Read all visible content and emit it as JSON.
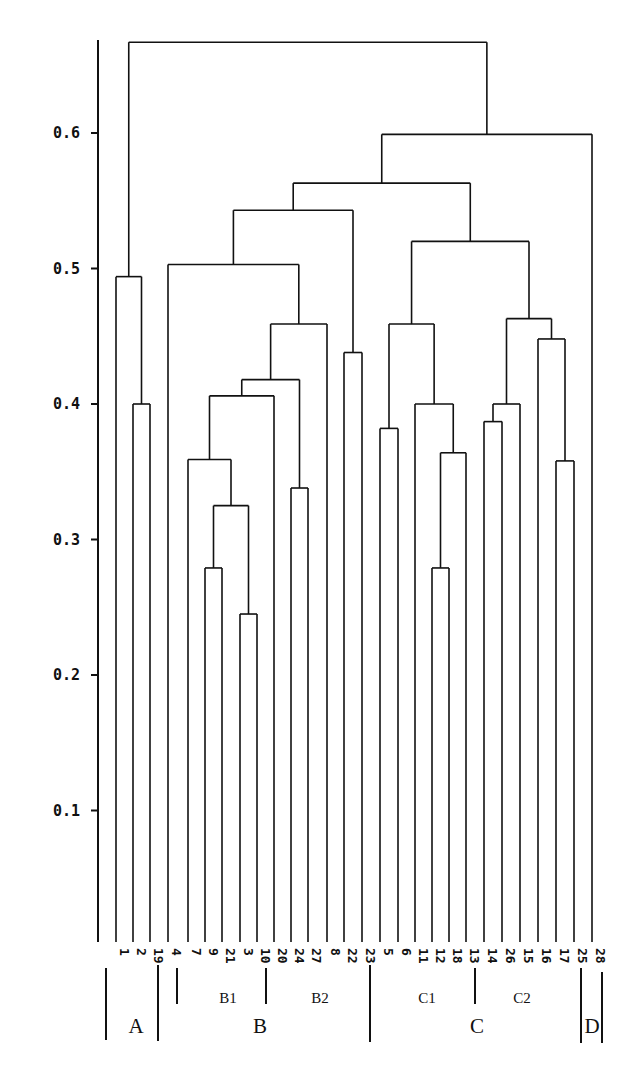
{
  "chart_data": {
    "type": "dendrogram",
    "title": "",
    "xlabel": "",
    "ylabel": "",
    "ylim": [
      0.0,
      0.67
    ],
    "y_ticks": [
      "0.1",
      "0.2",
      "0.3",
      "0.4",
      "0.5",
      "0.6"
    ],
    "leaf_order": [
      "1",
      "2",
      "19",
      "4",
      "7",
      "9",
      "21",
      "3",
      "10",
      "20",
      "24",
      "27",
      "8",
      "22",
      "23",
      "5",
      "6",
      "11",
      "12",
      "18",
      "13",
      "14",
      "26",
      "15",
      "16",
      "17",
      "25",
      "28"
    ],
    "merges": [
      {
        "id": "m1",
        "left": "2",
        "right": "19",
        "height": 0.4
      },
      {
        "id": "m2",
        "left": "1",
        "right": "m1",
        "height": 0.494
      },
      {
        "id": "m3",
        "left": "9",
        "right": "21",
        "height": 0.279
      },
      {
        "id": "m4",
        "left": "3",
        "right": "10",
        "height": 0.245
      },
      {
        "id": "m5",
        "left": "m3",
        "right": "m4",
        "height": 0.325
      },
      {
        "id": "m6",
        "left": "7",
        "right": "m5",
        "height": 0.359
      },
      {
        "id": "m7",
        "left": "m6",
        "right": "20",
        "height": 0.406
      },
      {
        "id": "m8",
        "left": "24",
        "right": "27",
        "height": 0.338
      },
      {
        "id": "m9",
        "left": "m7",
        "right": "m8",
        "height": 0.418
      },
      {
        "id": "m10",
        "left": "m9",
        "right": "8",
        "height": 0.459
      },
      {
        "id": "m11",
        "left": "4",
        "right": "m10",
        "height": 0.503
      },
      {
        "id": "m12",
        "left": "22",
        "right": "23",
        "height": 0.438
      },
      {
        "id": "m13",
        "left": "m11",
        "right": "m12",
        "height": 0.543
      },
      {
        "id": "m14",
        "left": "5",
        "right": "6",
        "height": 0.382
      },
      {
        "id": "m15",
        "left": "12",
        "right": "18",
        "height": 0.279
      },
      {
        "id": "m16",
        "left": "m15",
        "right": "13",
        "height": 0.364
      },
      {
        "id": "m17",
        "left": "11",
        "right": "m16",
        "height": 0.4
      },
      {
        "id": "m18",
        "left": "m14",
        "right": "m17",
        "height": 0.459
      },
      {
        "id": "m19",
        "left": "14",
        "right": "26",
        "height": 0.387
      },
      {
        "id": "m20",
        "left": "m19",
        "right": "15",
        "height": 0.4
      },
      {
        "id": "m21",
        "left": "17",
        "right": "25",
        "height": 0.358
      },
      {
        "id": "m22",
        "left": "16",
        "right": "m21",
        "height": 0.448
      },
      {
        "id": "m23",
        "left": "m20",
        "right": "m22",
        "height": 0.463
      },
      {
        "id": "m24",
        "left": "m18",
        "right": "m23",
        "height": 0.52
      },
      {
        "id": "m25",
        "left": "m13",
        "right": "m24",
        "height": 0.563
      },
      {
        "id": "m26",
        "left": "m25",
        "right": "28",
        "height": 0.599
      },
      {
        "id": "m27",
        "left": "m2",
        "right": "m26",
        "height": 0.667
      }
    ],
    "groups": [
      {
        "label": "A",
        "level": "major",
        "leaves": [
          "1",
          "2",
          "19"
        ]
      },
      {
        "label": "B",
        "level": "major",
        "leaves": [
          "4",
          "7",
          "9",
          "21",
          "3",
          "10",
          "20",
          "24",
          "27",
          "8",
          "22",
          "23"
        ]
      },
      {
        "label": "C",
        "level": "major",
        "leaves": [
          "5",
          "6",
          "11",
          "12",
          "18",
          "13",
          "14",
          "26",
          "15",
          "16",
          "17",
          "25"
        ]
      },
      {
        "label": "D",
        "level": "major",
        "leaves": [
          "28"
        ]
      },
      {
        "label": "B1",
        "level": "minor",
        "leaves": [
          "7",
          "9",
          "21",
          "3",
          "10"
        ]
      },
      {
        "label": "B2",
        "level": "minor",
        "leaves": [
          "20",
          "24",
          "27",
          "8",
          "22",
          "23"
        ]
      },
      {
        "label": "C1",
        "level": "minor",
        "leaves": [
          "5",
          "6",
          "11",
          "12",
          "18",
          "13"
        ]
      },
      {
        "label": "C2",
        "level": "minor",
        "leaves": [
          "14",
          "26",
          "15",
          "16",
          "17",
          "25"
        ]
      }
    ]
  },
  "layout": {
    "axis_x": 98,
    "axis_top": 40,
    "axis_bottom": 942,
    "y_zero_px": 946,
    "px_per_unit": 1355,
    "leaf_bottom": 942,
    "leaf_x": [
      116,
      133,
      150,
      168,
      188,
      205,
      222,
      240,
      257,
      274,
      291,
      308,
      327,
      344,
      362,
      380,
      398,
      415,
      432,
      449,
      466,
      484,
      502,
      520,
      538,
      556,
      574,
      592
    ],
    "leaf_label_y": 948,
    "brackets": [
      {
        "x": 106,
        "y1": 968,
        "y2": 1040
      },
      {
        "x": 158,
        "y1": 965,
        "y2": 1041
      },
      {
        "x": 177,
        "y1": 968,
        "y2": 1004
      },
      {
        "x": 266,
        "y1": 968,
        "y2": 1004
      },
      {
        "x": 370,
        "y1": 965,
        "y2": 1042
      },
      {
        "x": 475,
        "y1": 968,
        "y2": 1004
      },
      {
        "x": 581,
        "y1": 968,
        "y2": 1043
      },
      {
        "x": 602,
        "y1": 972,
        "y2": 1043
      }
    ],
    "group_label_pos": {
      "A": [
        136,
        1033
      ],
      "B": [
        260,
        1033
      ],
      "C": [
        477,
        1033
      ],
      "D": [
        592,
        1033
      ],
      "B1": [
        228,
        1003
      ],
      "B2": [
        320,
        1003
      ],
      "C1": [
        427,
        1003
      ],
      "C2": [
        522,
        1003
      ]
    }
  }
}
